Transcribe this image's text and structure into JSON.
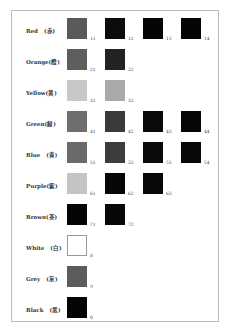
{
  "rows": [
    {
      "label": "Red　(赤)",
      "swatches": [
        {
          "code": "11",
          "color": "#5a5a5a"
        },
        {
          "code": "12",
          "color": "#0c0c0c"
        },
        {
          "code": "13",
          "color": "#050505"
        },
        {
          "code": "14",
          "color": "#050505"
        }
      ]
    },
    {
      "label": "Orange(橙)",
      "swatches": [
        {
          "code": "21",
          "color": "#5e5e5e"
        },
        {
          "code": "22",
          "color": "#222222"
        }
      ]
    },
    {
      "label": "Yellow(黄)",
      "swatches": [
        {
          "code": "31",
          "color": "#c8c8c8"
        },
        {
          "code": "32",
          "color": "#a9a9a9"
        }
      ]
    },
    {
      "label": "Green(緑)",
      "swatches": [
        {
          "code": "41",
          "color": "#6e6e6e"
        },
        {
          "code": "42",
          "color": "#3a3a3a"
        },
        {
          "code": "43",
          "color": "#0a0a0a"
        },
        {
          "code": "44",
          "color": "#060606"
        }
      ]
    },
    {
      "label": "Blue　(青)",
      "swatches": [
        {
          "code": "51",
          "color": "#6a6a6a"
        },
        {
          "code": "52",
          "color": "#3c3c3c"
        },
        {
          "code": "53",
          "color": "#0a0a0a"
        },
        {
          "code": "54",
          "color": "#080808"
        }
      ]
    },
    {
      "label": "Purple(紫)",
      "swatches": [
        {
          "code": "61",
          "color": "#c4c4c4"
        },
        {
          "code": "62",
          "color": "#060606"
        },
        {
          "code": "63",
          "color": "#080808"
        }
      ]
    },
    {
      "label": "Brown(茶)",
      "swatches": [
        {
          "code": "71",
          "color": "#050505"
        },
        {
          "code": "72",
          "color": "#070707"
        }
      ]
    },
    {
      "label": "White　(白)",
      "swatches": [
        {
          "code": "8",
          "color": "#ffffff"
        }
      ]
    },
    {
      "label": "Grey　(灰)",
      "swatches": [
        {
          "code": "9",
          "color": "#5c5c5c"
        }
      ]
    },
    {
      "label": "Black　(黒)",
      "swatches": [
        {
          "code": "0",
          "color": "#040404"
        }
      ]
    }
  ]
}
